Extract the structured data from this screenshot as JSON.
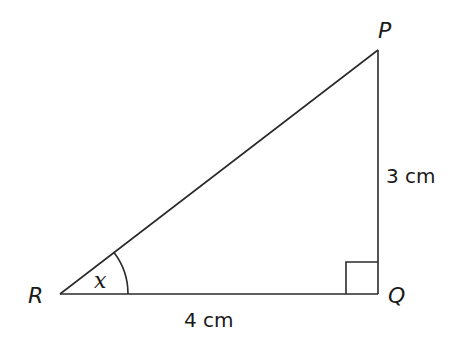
{
  "diagram": {
    "type": "right-triangle",
    "colors": {
      "stroke": "#2a2a2a",
      "text": "#1a1a1a",
      "background": "#ffffff"
    },
    "vertices": {
      "P": {
        "label": "P"
      },
      "Q": {
        "label": "Q"
      },
      "R": {
        "label": "R"
      }
    },
    "angle": {
      "vertex": "R",
      "label": "x"
    },
    "right_angle_at": "Q",
    "sides": {
      "RQ": {
        "label": "4 cm"
      },
      "PQ": {
        "label": "3 cm"
      }
    }
  }
}
